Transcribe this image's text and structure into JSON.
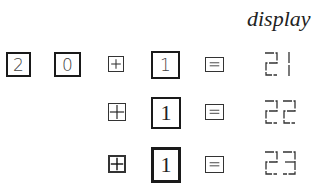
{
  "header": {
    "title": "display"
  },
  "rows": [
    {
      "keys": [
        "2",
        "0"
      ],
      "operator": "plus",
      "operand": "1",
      "equals": "=",
      "display": "21"
    },
    {
      "keys": [],
      "operator": "plus",
      "operand": "1",
      "equals": "=",
      "display": "22"
    },
    {
      "keys": [],
      "operator": "plus",
      "operand": "1",
      "equals": "=",
      "display": "23"
    }
  ],
  "icons": {
    "plus_key": "plus-key-icon",
    "equals_key": "equals-key-icon"
  },
  "colors": {
    "ink": "#1a1a1a",
    "background": "#ffffff"
  }
}
